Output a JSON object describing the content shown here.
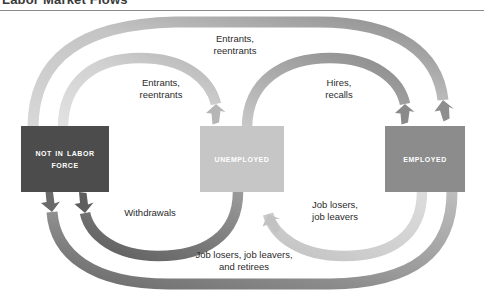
{
  "figure": {
    "title": "Labor Market Flows"
  },
  "nodes": [
    {
      "id": "not-in-labor-force",
      "label": "Not in Labor Force",
      "color": "#4c4c4c"
    },
    {
      "id": "unemployed",
      "label": "Unemployed",
      "color": "#c6c6c6"
    },
    {
      "id": "employed",
      "label": "Employed",
      "color": "#8c8c8c"
    }
  ],
  "flows": [
    {
      "id": "entrants-reentrants-to-employed",
      "label": "Entrants, reentrants",
      "label_lines": [
        "Entrants,",
        "reentrants"
      ],
      "from": "not-in-labor-force",
      "to": "employed",
      "color": "#c9c9c9",
      "route": "outer-top"
    },
    {
      "id": "entrants-reentrants-to-unemployed",
      "label": "Entrants, reentrants",
      "label_lines": [
        "Entrants,",
        "reentrants"
      ],
      "from": "not-in-labor-force",
      "to": "unemployed",
      "color": "#d2d2d2",
      "route": "inner-top-left"
    },
    {
      "id": "hires-recalls",
      "label": "Hires, recalls",
      "label_lines": [
        "Hires,",
        "recalls"
      ],
      "from": "unemployed",
      "to": "employed",
      "color": "#9a9a9a",
      "route": "inner-top-right"
    },
    {
      "id": "job-losers-job-leavers",
      "label": "Job losers, job leavers",
      "label_lines": [
        "Job losers,",
        "job leavers"
      ],
      "from": "employed",
      "to": "unemployed",
      "color": "#cfcfcf",
      "route": "inner-bottom-right"
    },
    {
      "id": "withdrawals",
      "label": "Withdrawals",
      "label_lines": [
        "Withdrawals"
      ],
      "from": "unemployed",
      "to": "not-in-labor-force",
      "color": "#6e6e6e",
      "route": "inner-bottom-left"
    },
    {
      "id": "job-losers-job-leavers-retirees",
      "label": "Job losers, job leavers, and retirees",
      "label_lines": [
        "Job losers, job leavers,",
        "and retirees"
      ],
      "from": "employed",
      "to": "not-in-labor-force",
      "color": "#8f8f8f",
      "route": "outer-bottom"
    }
  ]
}
